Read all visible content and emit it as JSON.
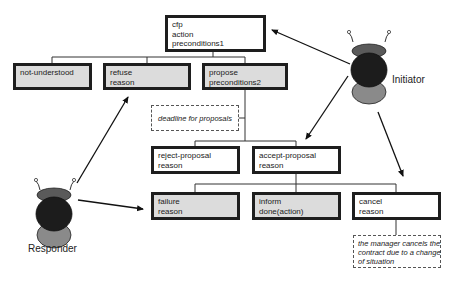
{
  "diagram": {
    "type": "FIPA Contract Net interaction protocol",
    "agents": {
      "initiator": {
        "label": "Initiator"
      },
      "responder": {
        "label": "Responder"
      }
    },
    "messages": {
      "cfp": {
        "lines": [
          "cfp",
          "action",
          "preconditions1"
        ],
        "sender": "initiator"
      },
      "not_understood": {
        "lines": [
          "not-understood"
        ],
        "sender": "responder"
      },
      "refuse": {
        "lines": [
          "refuse",
          "reason"
        ],
        "sender": "responder"
      },
      "propose": {
        "lines": [
          "propose",
          "preconditions2"
        ],
        "sender": "responder"
      },
      "reject_proposal": {
        "lines": [
          "reject-proposal",
          "reason"
        ],
        "sender": "initiator"
      },
      "accept_proposal": {
        "lines": [
          "accept-proposal",
          "reason"
        ],
        "sender": "initiator"
      },
      "failure": {
        "lines": [
          "failure",
          "reason"
        ],
        "sender": "responder"
      },
      "inform": {
        "lines": [
          "inform",
          "done(action)"
        ],
        "sender": "responder"
      },
      "cancel": {
        "lines": [
          "cancel",
          "reason"
        ],
        "sender": "initiator"
      }
    },
    "notes": {
      "deadline": {
        "text": "deadline for proposals"
      },
      "manager_cancel": {
        "lines": [
          "the manager cancels the",
          "contract due to a change",
          "of situation"
        ]
      }
    },
    "colors": {
      "responder_box_fill": "#dcdcdc",
      "initiator_box_fill": "#ffffff",
      "border": "#1e1e1e",
      "agent_head": "#5a5a5a",
      "agent_body": "#1c1c1c",
      "agent_base": "#8a8a8a"
    }
  }
}
